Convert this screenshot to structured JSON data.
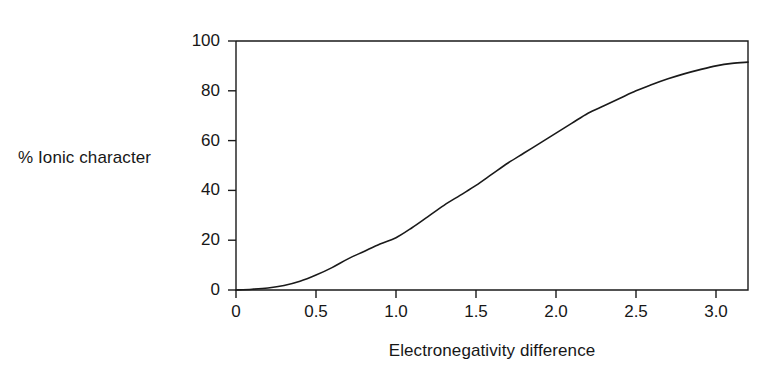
{
  "chart_data": {
    "type": "line",
    "title": "",
    "xlabel": "Electronegativity difference",
    "ylabel": "% Ionic character",
    "xlim": [
      0,
      3.2
    ],
    "ylim": [
      0,
      100
    ],
    "grid": false,
    "legend": "none",
    "xticks": [
      "0",
      "0.5",
      "1.0",
      "1.5",
      "2.0",
      "2.5",
      "3.0"
    ],
    "xtick_values": [
      0,
      0.5,
      1.0,
      1.5,
      2.0,
      2.5,
      3.0
    ],
    "yticks": [
      "0",
      "20",
      "40",
      "60",
      "80",
      "100"
    ],
    "ytick_values": [
      0,
      20,
      40,
      60,
      80,
      100
    ],
    "series": [
      {
        "name": "% Ionic character vs electronegativity difference",
        "color": "#1a1a1a",
        "x": [
          0.0,
          0.1,
          0.2,
          0.3,
          0.4,
          0.5,
          0.6,
          0.7,
          0.8,
          0.9,
          1.0,
          1.1,
          1.2,
          1.3,
          1.4,
          1.5,
          1.6,
          1.7,
          1.8,
          1.9,
          2.0,
          2.1,
          2.2,
          2.3,
          2.4,
          2.5,
          2.6,
          2.7,
          2.8,
          2.9,
          3.0,
          3.1,
          3.2
        ],
        "y": [
          0.0,
          0.3,
          0.8,
          1.8,
          3.5,
          6.0,
          9.0,
          12.5,
          15.5,
          18.5,
          21.0,
          25.0,
          29.5,
          34.0,
          38.0,
          42.0,
          46.5,
          51.0,
          55.0,
          59.0,
          63.0,
          67.0,
          71.0,
          74.0,
          77.0,
          80.0,
          82.5,
          84.8,
          86.8,
          88.5,
          90.0,
          91.0,
          91.5
        ]
      }
    ]
  },
  "axes": {
    "y_title": "% Ionic character",
    "x_title": "Electronegativity difference"
  }
}
